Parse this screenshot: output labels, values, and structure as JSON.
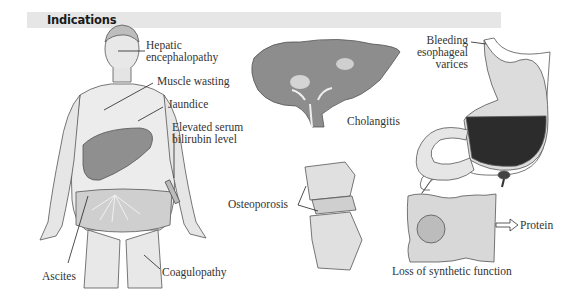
{
  "header": {
    "title": "Indications"
  },
  "figure": {
    "panels": [
      {
        "id": "patient",
        "labels": [
          {
            "key": "hepatic",
            "lines": [
              "Hepatic",
              "encephalopathy"
            ]
          },
          {
            "key": "muscle",
            "lines": [
              "Muscle wasting"
            ]
          },
          {
            "key": "jaundice",
            "lines": [
              "Jaundice"
            ]
          },
          {
            "key": "bilirubin",
            "lines": [
              "Elevated serum",
              "bilirubin level"
            ]
          },
          {
            "key": "ascites",
            "lines": [
              "Ascites"
            ]
          },
          {
            "key": "coag",
            "lines": [
              "Coagulopathy"
            ]
          }
        ]
      },
      {
        "id": "liver",
        "labels": [
          {
            "key": "cholangitis",
            "lines": [
              "Cholangitis"
            ]
          }
        ]
      },
      {
        "id": "stomach",
        "labels": [
          {
            "key": "varices",
            "lines": [
              "Bleeding",
              "esophageal",
              "varices"
            ]
          }
        ]
      },
      {
        "id": "spine",
        "labels": [
          {
            "key": "osteo",
            "lines": [
              "Osteoporosis"
            ]
          }
        ]
      },
      {
        "id": "cell",
        "labels": [
          {
            "key": "protein",
            "lines": [
              "Protein"
            ]
          },
          {
            "key": "synthetic",
            "lines": [
              "Loss of synthetic function"
            ]
          }
        ]
      }
    ]
  },
  "labels": {
    "hepatic_1": "Hepatic",
    "hepatic_2": "encephalopathy",
    "muscle": "Muscle wasting",
    "jaundice": "Jaundice",
    "bilirubin_1": "Elevated serum",
    "bilirubin_2": "bilirubin level",
    "ascites": "Ascites",
    "coag": "Coagulopathy",
    "cholangitis": "Cholangitis",
    "varices_1": "Bleeding",
    "varices_2": "esophageal",
    "varices_3": "varices",
    "osteo": "Osteoporosis",
    "protein": "Protein",
    "synthetic": "Loss of synthetic function"
  },
  "colors": {
    "header_bg": "#e6e6e6",
    "skin": "#ececec",
    "liver": "#9a9a9a",
    "blood": "#2b2b2b"
  }
}
